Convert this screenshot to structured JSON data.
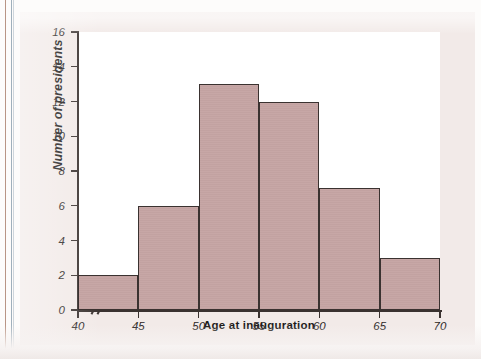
{
  "chart_data": {
    "type": "bar",
    "subtype": "histogram",
    "title": "",
    "xlabel": "Age at inauguration",
    "ylabel": "Number of presidents",
    "bin_width": 5,
    "bin_edges": [
      40,
      45,
      50,
      55,
      60,
      65,
      70
    ],
    "categories": [
      "40-45",
      "45-50",
      "50-55",
      "55-60",
      "60-65",
      "65-70"
    ],
    "values": [
      2,
      6,
      13,
      12,
      7,
      3
    ],
    "bars": [
      {
        "bin_start": 40,
        "bin_end": 45,
        "value": 2
      },
      {
        "bin_start": 45,
        "bin_end": 50,
        "value": 6
      },
      {
        "bin_start": 50,
        "bin_end": 55,
        "value": 13
      },
      {
        "bin_start": 55,
        "bin_end": 60,
        "value": 12
      },
      {
        "bin_start": 60,
        "bin_end": 65,
        "value": 7
      },
      {
        "bin_start": 65,
        "bin_end": 70,
        "value": 3
      }
    ],
    "xlim": [
      40,
      70
    ],
    "ylim": [
      0,
      16
    ],
    "x_ticks": [
      40,
      45,
      50,
      55,
      60,
      65,
      70
    ],
    "y_ticks": [
      0,
      2,
      4,
      6,
      8,
      10,
      12,
      14,
      16
    ],
    "x_tick_labels": [
      "40",
      "45",
      "50",
      "55",
      "60",
      "65",
      "70"
    ],
    "y_tick_labels": [
      "0",
      "2",
      "4",
      "6",
      "8",
      "10",
      "12",
      "14",
      "16"
    ],
    "grid": false,
    "legend": false,
    "legend_position": "none",
    "axis_break": {
      "axis": "x",
      "symbol": "//",
      "between": [
        0,
        40
      ]
    },
    "colors": {
      "bar_fill": "#c6a5a4",
      "bar_edge": "#3a3230",
      "plot_background": "#ffffff",
      "figure_background": "#f2eae8",
      "axis": "#3a3230",
      "text": "#1d1a19"
    }
  }
}
